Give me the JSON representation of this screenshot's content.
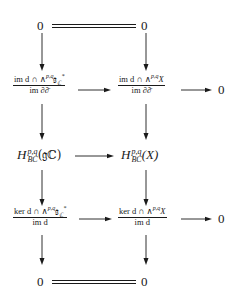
{
  "diagram": {
    "type": "commutative-diagram",
    "nodes": {
      "top_left": "0",
      "top_right": "0",
      "row2_left": {
        "num_prefix": "im d ∩ ∧",
        "num_sup": "p,q",
        "num_suffix": "𝔤",
        "num_sub": "ℂ",
        "num_star": "*",
        "den": "im ∂∂̄"
      },
      "row2_right": {
        "num_prefix": "im d ∩ ∧",
        "num_sup": "p,q",
        "num_suffix": "X",
        "den": "im ∂∂̄"
      },
      "row2_end": "0",
      "row3_left": {
        "H": "H",
        "sup": "p,q",
        "sub": "BC",
        "arg": "(𝔤ℂ)"
      },
      "row3_right": {
        "H": "H",
        "sup": "p,q",
        "sub": "BC",
        "arg": "(X)"
      },
      "row4_left": {
        "num_prefix": "ker d ∩ ∧",
        "num_sup": "p,q",
        "num_suffix": "𝔤",
        "num_sub": "ℂ",
        "num_star": "*",
        "den": "im d"
      },
      "row4_right": {
        "num_prefix": "ker d ∩ ∧",
        "num_sup": "p,q",
        "num_suffix": "X",
        "den": "im d"
      },
      "row4_end": "0",
      "bottom_left": "0",
      "bottom_right": "0"
    },
    "edges": [
      {
        "from": "top_left",
        "to": "top_right",
        "style": "double-line"
      },
      {
        "from": "top_left",
        "to": "row2_left",
        "style": "arrow"
      },
      {
        "from": "top_right",
        "to": "row2_right",
        "style": "arrow"
      },
      {
        "from": "row2_left",
        "to": "row2_right",
        "style": "arrow"
      },
      {
        "from": "row2_right",
        "to": "row2_end",
        "style": "arrow"
      },
      {
        "from": "row2_left",
        "to": "row3_left",
        "style": "arrow"
      },
      {
        "from": "row2_right",
        "to": "row3_right",
        "style": "arrow"
      },
      {
        "from": "row3_left",
        "to": "row3_right",
        "style": "arrow"
      },
      {
        "from": "row3_left",
        "to": "row4_left",
        "style": "arrow"
      },
      {
        "from": "row3_right",
        "to": "row4_right",
        "style": "arrow"
      },
      {
        "from": "row4_left",
        "to": "row4_right",
        "style": "arrow"
      },
      {
        "from": "row4_right",
        "to": "row4_end",
        "style": "arrow"
      },
      {
        "from": "row4_left",
        "to": "bottom_left",
        "style": "arrow"
      },
      {
        "from": "row4_right",
        "to": "bottom_right",
        "style": "arrow"
      },
      {
        "from": "bottom_left",
        "to": "bottom_right",
        "style": "double-line"
      }
    ]
  }
}
